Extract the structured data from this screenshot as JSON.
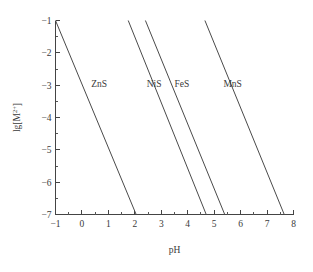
{
  "chart_data": {
    "type": "line",
    "title": "",
    "xlabel": "pH",
    "ylabel": "lg[M2+]",
    "ylabel_base": "lg[M",
    "ylabel_sup": "2+",
    "ylabel_tail": "]",
    "xlim": [
      -1,
      8
    ],
    "ylim": [
      -7,
      -1
    ],
    "grid": false,
    "legend_position": "inline-annotations",
    "xticks": [
      -1,
      0,
      1,
      2,
      3,
      4,
      5,
      6,
      7,
      8
    ],
    "xtick_labels": [
      "−1",
      "0",
      "1",
      "2",
      "3",
      "4",
      "5",
      "6",
      "7",
      "8"
    ],
    "yticks": [
      -1,
      -2,
      -3,
      -4,
      -5,
      -6,
      -7
    ],
    "ytick_labels": [
      "−1",
      "−2",
      "−3",
      "−4",
      "−5",
      "−6",
      "−7"
    ],
    "minor_tick_subdivisions": 2,
    "line_color": "#4a4a4a",
    "axis_color": "#444444",
    "background": "#ffffff",
    "series": [
      {
        "name": "ZnS",
        "label": "ZnS",
        "label_x": 0.35,
        "label_y": -3.05,
        "x": [
          -1.0,
          2.05
        ],
        "y": [
          -1.0,
          -7.0
        ],
        "values": [
          -1.0,
          -7.0
        ],
        "slope": -1.97
      },
      {
        "name": "NiS",
        "label": "NiS",
        "label_x": 2.45,
        "label_y": -3.05,
        "x": [
          1.75,
          4.7
        ],
        "y": [
          -1.0,
          -7.0
        ],
        "values": [
          -1.0,
          -7.0
        ],
        "slope": -2.03
      },
      {
        "name": "FeS",
        "label": "FeS",
        "label_x": 3.5,
        "label_y": -3.05,
        "x": [
          2.4,
          5.4
        ],
        "y": [
          -1.0,
          -7.0
        ],
        "values": [
          -1.0,
          -7.0
        ],
        "slope": -2.0
      },
      {
        "name": "MnS",
        "label": "MnS",
        "label_x": 5.35,
        "label_y": -3.05,
        "x": [
          4.65,
          7.65
        ],
        "y": [
          -1.0,
          -7.0
        ],
        "values": [
          -1.0,
          -7.0
        ],
        "slope": -2.0
      }
    ]
  }
}
